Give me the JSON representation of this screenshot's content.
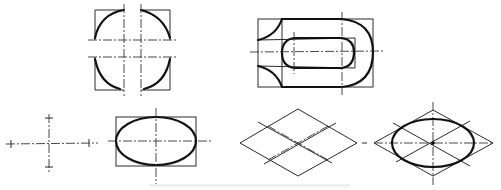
{
  "figure": {
    "colors": {
      "line": "#2a2a2a",
      "outline": "#111111",
      "background": "#ffffff",
      "caption": "#d8d8d8"
    },
    "panels": [
      {
        "id": "rounded-corners",
        "label": "Rounded corner sketch"
      },
      {
        "id": "slotted-plate",
        "label": "Slotted plate sketch"
      },
      {
        "id": "axes-cross",
        "label": "Center axes with marks"
      },
      {
        "id": "ellipse-in-rect",
        "label": "Ellipse inscribed in rectangle"
      },
      {
        "id": "rhombus-grid",
        "label": "Isometric rhombus construction"
      },
      {
        "id": "isometric-ellipse",
        "label": "Ellipse inscribed in rhombus"
      }
    ],
    "caption": ""
  }
}
